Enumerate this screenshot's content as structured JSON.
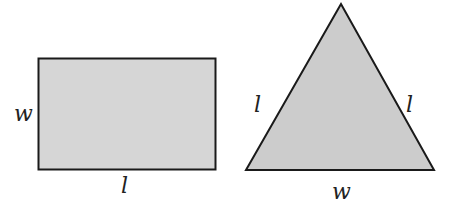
{
  "figure": {
    "rectangle": {
      "side_label": "w",
      "bottom_label": "l",
      "fill": "#d6d6d6",
      "stroke": "#1a1a1a"
    },
    "triangle": {
      "left_label": "l",
      "right_label": "l",
      "bottom_label": "w",
      "fill": "#cccccc",
      "stroke": "#1a1a1a"
    }
  }
}
